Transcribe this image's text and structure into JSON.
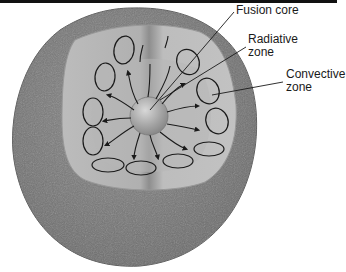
{
  "figure": {
    "labels": [
      {
        "id": "fusion-core",
        "lines": [
          "Fusion core"
        ]
      },
      {
        "id": "radiative-zone",
        "lines": [
          "Radiative",
          "zone"
        ]
      },
      {
        "id": "convective-zone",
        "lines": [
          "Convective",
          "zone"
        ]
      }
    ]
  },
  "colors": {
    "outer_shell": "#7a7a7a",
    "convective_zone": "#b4b4b4",
    "radiative_zone": "#a0a0a0",
    "core": "#c8c8c8",
    "lines": "#1a1a1a",
    "top_bar": "#111111"
  }
}
